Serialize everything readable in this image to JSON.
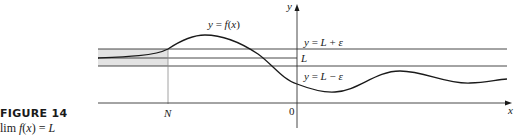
{
  "figure": {
    "title": "FIGURE 14",
    "caption": "lim f(x) = L"
  },
  "labels": {
    "curve": "y = f(x)",
    "upper_bound": "y = L + ε",
    "limit": "L",
    "lower_bound": "y = L − ε",
    "N": "N",
    "origin": "0",
    "x_axis": "x",
    "y_axis": "y"
  },
  "colors": {
    "line": "#1a1a1a",
    "band_shade": "#e3e3e3",
    "guide": "#8a8a8a"
  }
}
